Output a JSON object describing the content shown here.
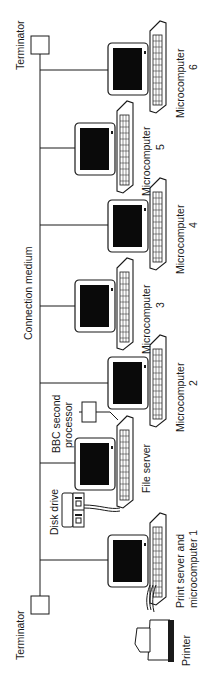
{
  "diagram": {
    "type": "bus-network",
    "orientation": "rotated-90-ccw",
    "bus_label": "Connection medium",
    "terminators": [
      {
        "label": "Terminator",
        "position": "top"
      },
      {
        "label": "Terminator",
        "position": "bottom"
      }
    ],
    "nodes": [
      {
        "id": "mc6",
        "line1": "Microcomputer",
        "line2": "6"
      },
      {
        "id": "mc5",
        "line1": "Microcomputer",
        "line2": "5"
      },
      {
        "id": "mc4",
        "line1": "Microcomputer",
        "line2": "4"
      },
      {
        "id": "mc3",
        "line1": "Microcomputer",
        "line2": "3"
      },
      {
        "id": "mc2",
        "line1": "Microcomputer",
        "line2": "2"
      },
      {
        "id": "fs",
        "line1": "File server",
        "line2": ""
      },
      {
        "id": "ps",
        "line1": "Print server and",
        "line2": "microcomputer 1"
      }
    ],
    "peripherals": [
      {
        "id": "second-processor",
        "line1": "BBC second",
        "line2": "processor"
      },
      {
        "id": "disk-drive",
        "line1": "Disk drive"
      },
      {
        "id": "printer",
        "line1": "Printer"
      }
    ],
    "colors": {
      "line": "#1a1a1a",
      "screen": "#0a0a0a",
      "background": "#ffffff"
    }
  }
}
